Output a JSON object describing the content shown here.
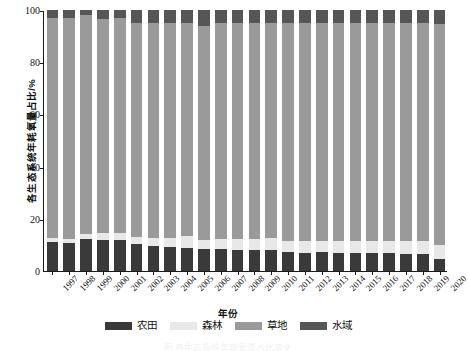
{
  "chart_data": {
    "type": "bar",
    "stacked": true,
    "percent_stacked": true,
    "title": "",
    "xlabel": "年份",
    "ylabel": "各生态系统年耗氧量占比/%",
    "ylim": [
      0,
      100
    ],
    "yticks": [
      0,
      20,
      40,
      60,
      80,
      100
    ],
    "grid": false,
    "legend_position": "bottom",
    "categories": [
      "1997",
      "1998",
      "1999",
      "2000",
      "2001",
      "2002",
      "2003",
      "2004",
      "2005",
      "2006",
      "2007",
      "2008",
      "2009",
      "2010",
      "2011",
      "2012",
      "2013",
      "2014",
      "2015",
      "2016",
      "2017",
      "2018",
      "2019",
      "2020"
    ],
    "series": [
      {
        "name": "农田",
        "color": "#3a3a3a",
        "values": [
          11.0,
          10.8,
          12.2,
          11.8,
          12.0,
          10.2,
          9.6,
          9.2,
          8.8,
          8.4,
          8.6,
          8.2,
          8.0,
          8.2,
          7.2,
          7.0,
          7.2,
          7.0,
          6.8,
          7.0,
          6.8,
          6.6,
          6.4,
          4.6
        ]
      },
      {
        "name": "森林",
        "color": "#e8e8e8",
        "values": [
          1.6,
          1.6,
          2.0,
          2.6,
          2.4,
          3.0,
          3.2,
          3.6,
          4.6,
          3.6,
          3.8,
          4.0,
          4.2,
          4.4,
          4.4,
          4.4,
          4.4,
          4.6,
          4.6,
          4.6,
          4.8,
          4.8,
          5.0,
          5.4
        ]
      },
      {
        "name": "草地",
        "color": "#9a9a9a",
        "values": [
          84.4,
          84.6,
          83.8,
          82.0,
          82.6,
          81.8,
          82.2,
          82.2,
          81.6,
          82.0,
          82.6,
          82.8,
          82.8,
          82.4,
          83.4,
          83.6,
          83.4,
          83.4,
          83.6,
          83.4,
          83.4,
          83.6,
          83.6,
          84.6
        ]
      },
      {
        "name": "水域",
        "color": "#565656",
        "values": [
          3.0,
          3.0,
          2.0,
          3.6,
          3.0,
          5.0,
          5.0,
          5.0,
          5.0,
          6.0,
          5.0,
          5.0,
          5.0,
          5.0,
          5.0,
          5.0,
          5.0,
          5.0,
          5.0,
          5.0,
          5.0,
          5.0,
          5.0,
          5.4
        ]
      }
    ]
  },
  "axis": {
    "y_title": "各生态系统年耗氧量占比/%",
    "x_title": "年份"
  },
  "legend": {
    "items": [
      {
        "label": "农田",
        "color": "#3a3a3a"
      },
      {
        "label": "森林",
        "color": "#e8e8e8"
      },
      {
        "label": "草地",
        "color": "#9a9a9a"
      },
      {
        "label": "水域",
        "color": "#565656"
      }
    ]
  },
  "caption": {
    "text": "图  各生态系统年耗氧量占比变化"
  }
}
